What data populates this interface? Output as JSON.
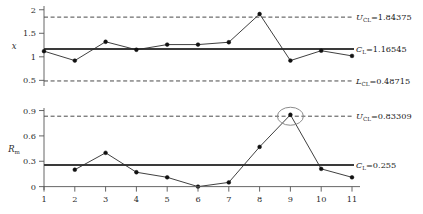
{
  "figure": {
    "type": "control-chart-pair",
    "width": 423,
    "height": 214
  },
  "colors": {
    "center_line": "#3a3a3a",
    "limit_line": "#4a4a4a",
    "series_line": "#2a2a2a",
    "marker": "#111111",
    "axis": "#555555",
    "highlight_ellipse": "#8c8c8c",
    "text": "#1a1a1a"
  },
  "charts": [
    {
      "id": "individuals-chart",
      "ylabel": "x",
      "ylabel_italic": true,
      "yticks": [
        "2",
        "1.5",
        "1",
        "0.5"
      ],
      "ytick_values": [
        2,
        1.5,
        1,
        0.5
      ],
      "ylim": [
        0.38,
        2.08
      ],
      "limits": {
        "ucl": {
          "value": 1.84375,
          "label_prefix": "U",
          "label_sub": "CL",
          "label": "U_CL=1.84375",
          "text": "=1.84375",
          "style": "dashed"
        },
        "cl": {
          "value": 1.16545,
          "label_prefix": "C",
          "label_sub": "L",
          "label": "C_L=1.16545",
          "text": "=1.16545",
          "style": "solid"
        },
        "lcl": {
          "value": 0.48715,
          "label_prefix": "L",
          "label_sub": "CL",
          "label": "L_CL=0.48715",
          "text": "=0.48715",
          "style": "dashed"
        }
      },
      "series": {
        "name": "individual measurement",
        "x": [
          1,
          2,
          3,
          4,
          5,
          6,
          7,
          8,
          9,
          10,
          11
        ],
        "values": [
          1.12,
          0.92,
          1.32,
          1.15,
          1.26,
          1.26,
          1.31,
          1.91,
          0.92,
          1.13,
          1.02
        ]
      }
    },
    {
      "id": "moving-range-chart",
      "ylabel": "R",
      "ylabel_sub": "m",
      "ylabel_italic": true,
      "yticks": [
        "0.9",
        "0.6",
        "0.3",
        "0"
      ],
      "ytick_values": [
        0.9,
        0.6,
        0.3,
        0
      ],
      "ylim": [
        -0.04,
        0.93
      ],
      "limits": {
        "ucl": {
          "value": 0.83309,
          "label_prefix": "U",
          "label_sub": "CL",
          "label": "U_CL=0.83309",
          "text": "=0.83309",
          "style": "dashed"
        },
        "cl": {
          "value": 0.255,
          "label_prefix": "C",
          "label_sub": "L",
          "label": "C_L=0.255",
          "text": "=0.255",
          "style": "solid"
        }
      },
      "series": {
        "name": "moving range",
        "x": [
          2,
          3,
          4,
          5,
          6,
          7,
          8,
          9,
          10,
          11
        ],
        "values": [
          0.2,
          0.4,
          0.17,
          0.11,
          0.0,
          0.05,
          0.47,
          0.85,
          0.21,
          0.11
        ]
      },
      "highlight": {
        "name": "out-of-control-point",
        "x": 9,
        "value": 0.85
      }
    }
  ],
  "xaxis": {
    "ticks": [
      "1",
      "2",
      "3",
      "4",
      "5",
      "6",
      "7",
      "8",
      "9",
      "10",
      "11"
    ],
    "values": [
      1,
      2,
      3,
      4,
      5,
      6,
      7,
      8,
      9,
      10,
      11
    ]
  },
  "chart_data": {
    "type": "line",
    "title": "",
    "xlabel": "",
    "ylabel": "x / R_m",
    "x": [
      1,
      2,
      3,
      4,
      5,
      6,
      7,
      8,
      9,
      10,
      11
    ],
    "series": [
      {
        "name": "x (individuals)",
        "values": [
          1.12,
          0.92,
          1.32,
          1.15,
          1.26,
          1.26,
          1.31,
          1.91,
          0.92,
          1.13,
          1.02
        ],
        "ylim": [
          0.38,
          2.08
        ],
        "control_limits": {
          "UCL": 1.84375,
          "CL": 1.16545,
          "LCL": 0.48715
        }
      },
      {
        "name": "R_m (moving range)",
        "values": [
          null,
          0.2,
          0.4,
          0.17,
          0.11,
          0.0,
          0.05,
          0.47,
          0.85,
          0.21,
          0.11
        ],
        "ylim": [
          -0.04,
          0.93
        ],
        "control_limits": {
          "UCL": 0.83309,
          "CL": 0.255
        }
      }
    ],
    "annotations": [
      {
        "text": "U_CL=1.84375",
        "target": "individuals UCL"
      },
      {
        "text": "C_L=1.16545",
        "target": "individuals CL"
      },
      {
        "text": "L_CL=0.48715",
        "target": "individuals LCL"
      },
      {
        "text": "U_CL=0.83309",
        "target": "moving range UCL"
      },
      {
        "text": "C_L=0.255",
        "target": "moving range CL"
      },
      {
        "text": "ellipse highlight at sample 9",
        "target": "moving range point 9 = 0.85"
      }
    ],
    "grid": false,
    "legend": "none"
  }
}
